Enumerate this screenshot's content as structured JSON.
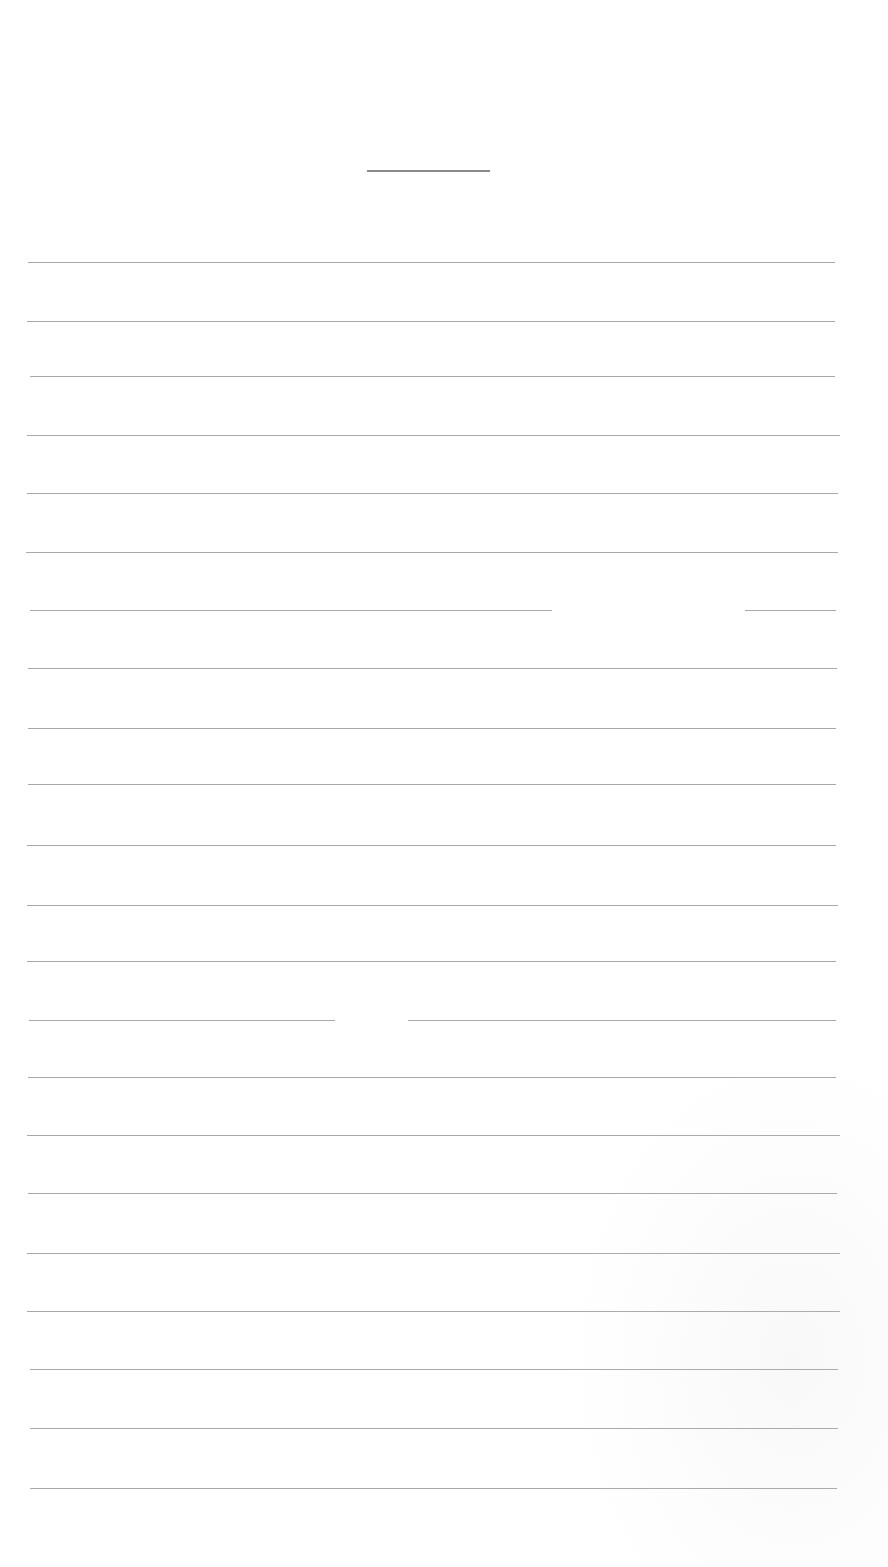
{
  "page": {
    "type": "blank ruled writing sheet",
    "background": "#ffffff",
    "rule_color": "#9a9a9a",
    "title_rule": {
      "x1": 367,
      "x2": 490,
      "y": 170
    },
    "rules": [
      {
        "y": 262,
        "x1": 28,
        "x2": 835
      },
      {
        "y": 321,
        "x1": 27,
        "x2": 835
      },
      {
        "y": 376,
        "x1": 30,
        "x2": 835
      },
      {
        "y": 435,
        "x1": 27,
        "x2": 840
      },
      {
        "y": 493,
        "x1": 27,
        "x2": 838
      },
      {
        "y": 552,
        "x1": 26,
        "x2": 838
      },
      {
        "y": 610,
        "x1": 30,
        "x2": 836,
        "gap": [
          552,
          745
        ]
      },
      {
        "y": 668,
        "x1": 28,
        "x2": 837
      },
      {
        "y": 728,
        "x1": 28,
        "x2": 836
      },
      {
        "y": 784,
        "x1": 28,
        "x2": 836
      },
      {
        "y": 845,
        "x1": 27,
        "x2": 836
      },
      {
        "y": 905,
        "x1": 27,
        "x2": 838
      },
      {
        "y": 961,
        "x1": 27,
        "x2": 836
      },
      {
        "y": 1020,
        "x1": 29,
        "x2": 836,
        "gap": [
          335,
          408
        ]
      },
      {
        "y": 1077,
        "x1": 28,
        "x2": 836
      },
      {
        "y": 1135,
        "x1": 27,
        "x2": 840
      },
      {
        "y": 1193,
        "x1": 28,
        "x2": 837
      },
      {
        "y": 1253,
        "x1": 27,
        "x2": 840
      },
      {
        "y": 1311,
        "x1": 27,
        "x2": 840
      },
      {
        "y": 1369,
        "x1": 30,
        "x2": 838
      },
      {
        "y": 1428,
        "x1": 30,
        "x2": 838
      },
      {
        "y": 1488,
        "x1": 30,
        "x2": 837
      }
    ]
  }
}
